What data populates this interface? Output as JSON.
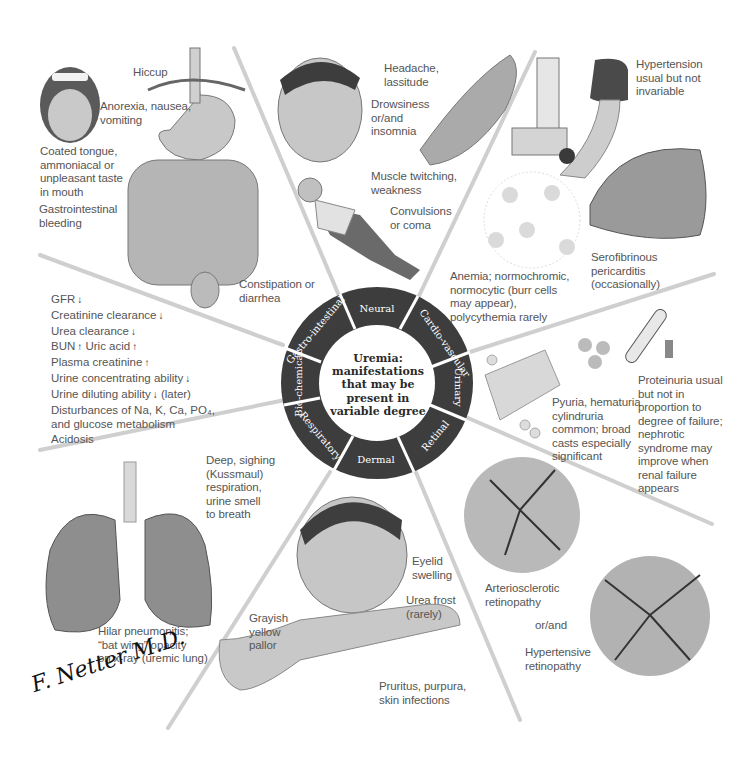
{
  "center": {
    "title": "Uremia: manifestations that may be present in variable degree",
    "title_lines": [
      "Uremia:",
      "manifestations",
      "that may be",
      "present in",
      "variable degree"
    ]
  },
  "wheel": {
    "ring_color": "#3d3d3d",
    "segments": [
      {
        "label": "Neural"
      },
      {
        "label": "Cardio-vascular"
      },
      {
        "label": "Urinary"
      },
      {
        "label": "Retinal"
      },
      {
        "label": "Dermal"
      },
      {
        "label": "Respiratory"
      },
      {
        "label": "Bio-chemical"
      },
      {
        "label": "Gastro-intestinal"
      }
    ]
  },
  "sections": {
    "gastrointestinal": {
      "hiccup": "Hiccup",
      "anorexia": "Anorexia, nausea,\nvomiting",
      "tongue": "Coated tongue,\nammoniacal or\nunpleasant taste\nin mouth",
      "bleeding": "Gastrointestinal\nbleeding",
      "constipation": "Constipation or\ndiarrhea"
    },
    "neural": {
      "headache": "Headache,\nlassitude",
      "drowsiness": "Drowsiness\nor/and\ninsomnia",
      "muscle": "Muscle twitching,\nweakness",
      "convulsions": "Convulsions\nor coma"
    },
    "cardiovascular": {
      "hypertension": "Hypertension\nusual but not\ninvariable",
      "pericarditis": "Serofibrinous\npericarditis\n(occasionally)",
      "anemia": "Anemia; normochromic,\nnormocytic (burr cells\nmay appear),\npolycythemia rarely"
    },
    "urinary": {
      "pyuria": "Pyuria, hematuria\ncylindruria\ncommon; broad\ncasts especially\nsignificant",
      "proteinuria": "Proteinuria usual\nbut not in\nproportion to\ndegree of failure;\nnephrotic\nsyndrome may\nimprove when\nrenal failure\nappears"
    },
    "retinal": {
      "arteriosclerotic": "Arteriosclerotic\nretinopathy",
      "or_and": "or/and",
      "hypertensive": "Hypertensive\nretinopathy"
    },
    "dermal": {
      "eyelid": "Eyelid\nswelling",
      "urea_frost": "Urea frost\n(rarely)",
      "pallor": "Grayish\nyellow\npallor",
      "pruritus": "Pruritus, purpura,\nskin infections"
    },
    "respiratory": {
      "kussmaul": "Deep, sighing\n(Kussmaul)\nrespiration,\nurine smell\nto breath",
      "hilar": "Hilar pneumonitis;\n“bat wing” opacity\non x-ray (uremic lung)"
    },
    "biochemical": {
      "items": [
        {
          "text": "GFR",
          "arrow": "↓"
        },
        {
          "text": "Creatinine clearance",
          "arrow": "↓"
        },
        {
          "text": "Urea clearance",
          "arrow": "↓"
        },
        {
          "text": "BUN",
          "arrow": "↑",
          "extra": " Uric acid",
          "extra_arrow": "↑"
        },
        {
          "text": "Plasma creatinine",
          "arrow": "↑"
        },
        {
          "text": "Urine concentrating ability",
          "arrow": "↓"
        },
        {
          "text": "Urine diluting ability",
          "arrow": "↓",
          "extra": " (later)"
        },
        {
          "text": "Disturbances of Na, K, Ca, PO₄,"
        },
        {
          "text": "and glucose metabolism"
        },
        {
          "text": "Acidosis"
        }
      ]
    }
  },
  "signature": "F. Netter M.D."
}
